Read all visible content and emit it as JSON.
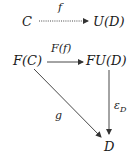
{
  "diagram": {
    "objects": {
      "C": "C",
      "UD": "U(D)",
      "FC": "F(C)",
      "FUD": "FU(D)",
      "D": "D"
    },
    "morphisms": {
      "f": {
        "label": "f",
        "from": "C",
        "to": "U(D)",
        "style": "dotted"
      },
      "Ff": {
        "label": "F(f)",
        "from": "F(C)",
        "to": "FU(D)",
        "style": "solid"
      },
      "g": {
        "label": "g",
        "from": "F(C)",
        "to": "D",
        "style": "solid"
      },
      "epsilon": {
        "label_base": "ε",
        "label_sub": "D",
        "from": "FU(D)",
        "to": "D",
        "style": "solid"
      }
    },
    "colors": {
      "ink": "#1a1a1a",
      "arrow": "#333333",
      "background": "#ffffff"
    }
  }
}
